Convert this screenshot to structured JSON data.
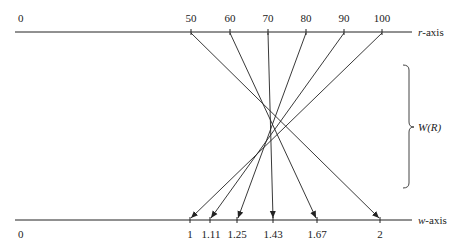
{
  "diagram": {
    "r_axis": {
      "label_var": "r",
      "label_suffix": "-axis",
      "origin_label": "0",
      "ticks": [
        "50",
        "60",
        "70",
        "80",
        "90",
        "100"
      ]
    },
    "w_axis": {
      "label_var": "w",
      "label_suffix": "-axis",
      "origin_label": "0",
      "ticks": [
        "1",
        "1.11",
        "1.25",
        "1.43",
        "1.67",
        "2"
      ]
    },
    "range_label": "W(R)",
    "mappings": [
      {
        "r": "50",
        "w": "2"
      },
      {
        "r": "60",
        "w": "1.67"
      },
      {
        "r": "70",
        "w": "1.43"
      },
      {
        "r": "80",
        "w": "1.25"
      },
      {
        "r": "90",
        "w": "1.11"
      },
      {
        "r": "100",
        "w": "1"
      }
    ],
    "line_color": "#222222"
  }
}
